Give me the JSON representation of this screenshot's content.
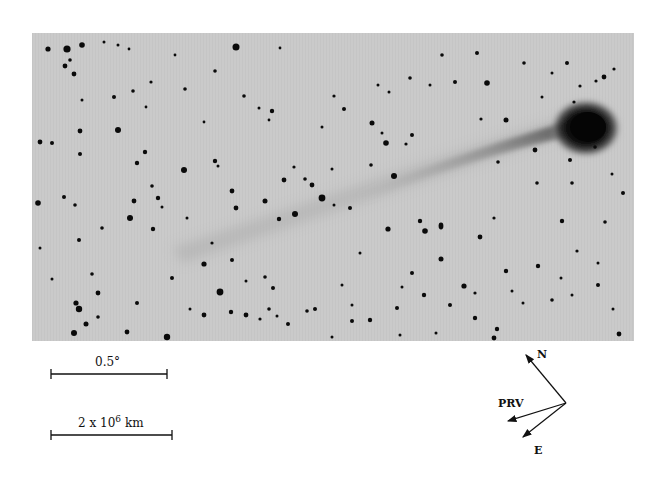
{
  "figure": {
    "photo": {
      "background_color": "#c9c9c9",
      "star_color": "#0a0a0a",
      "comet": {
        "head_position": "upper right",
        "tail_direction": "toward lower left"
      }
    },
    "scale_bars": [
      {
        "label": "0.5°",
        "unit": "angular"
      },
      {
        "label_base": "2 x 10",
        "label_exponent": "6",
        "label_unit": "km",
        "unit": "linear"
      }
    ],
    "compass": {
      "north_label": "N",
      "east_label": "E",
      "prv_label": "PRV"
    }
  }
}
